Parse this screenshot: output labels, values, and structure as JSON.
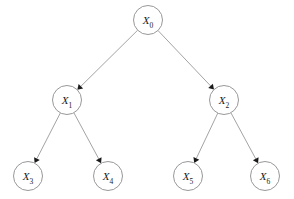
{
  "diagram": {
    "type": "directed-tree",
    "title": "",
    "background_color": "#ffffff",
    "node_stroke_color": "#8c8c8c",
    "node_fill_color": "#ffffff",
    "edge_color": "#8c8c8c",
    "arrow_color": "#1a1a1a",
    "label_color": "#1a1a1a",
    "node_radius": 14.5,
    "nodes": [
      {
        "id": "X0",
        "base": "X",
        "subscript": "0",
        "label": "X0",
        "cx": 148,
        "cy": 20,
        "level": 0
      },
      {
        "id": "X1",
        "base": "X",
        "subscript": "1",
        "label": "X1",
        "cx": 67,
        "cy": 100,
        "level": 1
      },
      {
        "id": "X2",
        "base": "X",
        "subscript": "2",
        "label": "X2",
        "cx": 224,
        "cy": 100,
        "level": 1
      },
      {
        "id": "X3",
        "base": "X",
        "subscript": "3",
        "label": "X3",
        "cx": 28,
        "cy": 176,
        "level": 2
      },
      {
        "id": "X4",
        "base": "X",
        "subscript": "4",
        "label": "X4",
        "cx": 108,
        "cy": 176,
        "level": 2
      },
      {
        "id": "X5",
        "base": "X",
        "subscript": "5",
        "label": "X5",
        "cx": 188,
        "cy": 176,
        "level": 2
      },
      {
        "id": "X6",
        "base": "X",
        "subscript": "6",
        "label": "X6",
        "cx": 265,
        "cy": 176,
        "level": 2
      }
    ],
    "edges": [
      {
        "id": "edge-X0-X1",
        "from": "X0",
        "to": "X1",
        "directed": true
      },
      {
        "id": "edge-X0-X2",
        "from": "X0",
        "to": "X2",
        "directed": true
      },
      {
        "id": "edge-X1-X3",
        "from": "X1",
        "to": "X3",
        "directed": true
      },
      {
        "id": "edge-X1-X4",
        "from": "X1",
        "to": "X4",
        "directed": true
      },
      {
        "id": "edge-X2-X5",
        "from": "X2",
        "to": "X5",
        "directed": true
      },
      {
        "id": "edge-X2-X6",
        "from": "X2",
        "to": "X6",
        "directed": true
      }
    ]
  }
}
